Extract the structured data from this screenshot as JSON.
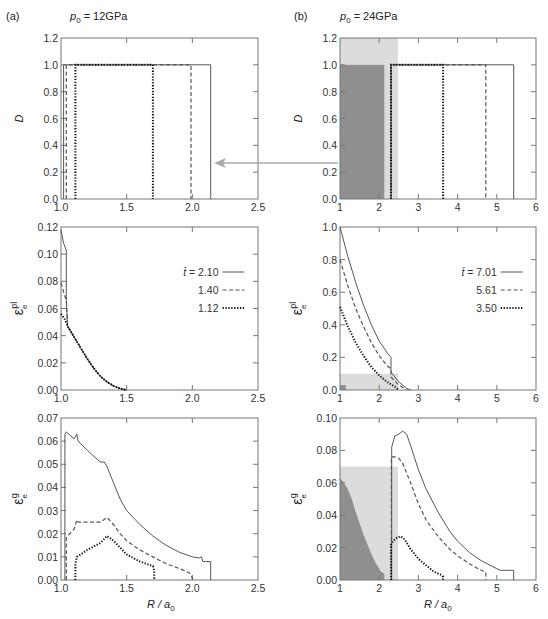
{
  "figure": {
    "panel_a": {
      "label": "(a)",
      "pressure": "p0 = 12GPa",
      "p_sym": "p",
      "p_sub": "0",
      "p_val": " = 12GPa"
    },
    "panel_b": {
      "label": "(b)",
      "pressure": "p0 = 24GPa",
      "p_sym": "p",
      "p_sub": "0",
      "p_val": " = 24GPa"
    },
    "xlabel": "R / a0",
    "xlabel_main": "R / a",
    "xlabel_sub": "0"
  },
  "colors": {
    "frame": "#777777",
    "line": "#555555",
    "dark_shade": "#8f8f8f",
    "light_shade": "#dcdcdc",
    "arrow": "#aaaaaa"
  },
  "chart_data": [
    {
      "id": "a-top",
      "type": "line",
      "title": "(a) p0 = 12GPa",
      "ylabel": "D",
      "xlabel": "",
      "xlim": [
        1.0,
        2.5
      ],
      "ylim": [
        0,
        1.2
      ],
      "xticks": [
        "1.0",
        "1.5",
        "2.0",
        "2.5"
      ],
      "xtick_vals": [
        1.0,
        1.5,
        2.0,
        2.5
      ],
      "yticks": [
        "0.0",
        "0.2",
        "0.4",
        "0.6",
        "0.8",
        "1.0",
        "1.2"
      ],
      "ytick_vals": [
        0,
        0.2,
        0.4,
        0.6,
        0.8,
        1.0,
        1.2
      ],
      "series": [
        {
          "name": "t=2.10",
          "style": "solid",
          "x": [
            1.02,
            1.02,
            2.14,
            2.14
          ],
          "y": [
            0,
            1,
            1,
            0
          ]
        },
        {
          "name": "t=1.40",
          "style": "dashed",
          "x": [
            1.04,
            1.04,
            1.99,
            1.99
          ],
          "y": [
            0,
            1,
            1,
            0
          ]
        },
        {
          "name": "t=1.12",
          "style": "dotted",
          "x": [
            1.11,
            1.11,
            1.7,
            1.7
          ],
          "y": [
            0,
            1,
            1,
            0
          ]
        }
      ]
    },
    {
      "id": "b-top",
      "type": "line",
      "title": "(b) p0 = 24GPa",
      "ylabel": "D",
      "xlabel": "",
      "xlim": [
        1,
        6
      ],
      "ylim": [
        0,
        1.2
      ],
      "xticks": [
        "1",
        "2",
        "3",
        "4",
        "5",
        "6"
      ],
      "xtick_vals": [
        1,
        2,
        3,
        4,
        5,
        6
      ],
      "yticks": [
        "0.0",
        "0.2",
        "0.4",
        "0.6",
        "0.8",
        "1.0",
        "1.2"
      ],
      "ytick_vals": [
        0,
        0.2,
        0.4,
        0.6,
        0.8,
        1.0,
        1.2
      ],
      "shading": {
        "light": {
          "x": [
            1,
            2.48
          ],
          "y": [
            0,
            1.2
          ]
        },
        "dark": {
          "x": [
            1,
            2.13
          ],
          "y": [
            0,
            1.0
          ]
        }
      },
      "series": [
        {
          "name": "t=7.01",
          "style": "solid",
          "x": [
            2.3,
            2.3,
            5.43,
            5.43
          ],
          "y": [
            0,
            1,
            1,
            0
          ]
        },
        {
          "name": "t=5.61",
          "style": "dashed",
          "x": [
            2.3,
            2.3,
            4.72,
            4.72
          ],
          "y": [
            0,
            1,
            1,
            0
          ]
        },
        {
          "name": "t=3.50",
          "style": "dotted",
          "x": [
            2.3,
            2.3,
            3.63,
            3.63
          ],
          "y": [
            0,
            1,
            1,
            0
          ]
        }
      ]
    },
    {
      "id": "a-mid",
      "type": "line",
      "ylabel": "εe^pl",
      "xlabel": "",
      "xlim": [
        1.0,
        2.5
      ],
      "ylim": [
        0,
        0.12
      ],
      "xticks": [
        "1.0",
        "1.5",
        "2.0",
        "2.5"
      ],
      "xtick_vals": [
        1.0,
        1.5,
        2.0,
        2.5
      ],
      "yticks": [
        "0.00",
        "0.02",
        "0.04",
        "0.06",
        "0.08",
        "0.10",
        "0.12"
      ],
      "ytick_vals": [
        0,
        0.02,
        0.04,
        0.06,
        0.08,
        0.1,
        0.12
      ],
      "legend": [
        {
          "prefix": "t̄ = ",
          "value": "2.10",
          "style": "solid"
        },
        {
          "prefix": "",
          "value": "1.40",
          "style": "dashed"
        },
        {
          "prefix": "",
          "value": "1.12",
          "style": "dotted"
        }
      ],
      "series": [
        {
          "name": "t=2.10",
          "style": "solid",
          "x": [
            1.0,
            1.02,
            1.04,
            1.04,
            1.05,
            1.1,
            1.15,
            1.2,
            1.25,
            1.3,
            1.35,
            1.4,
            1.45,
            1.5
          ],
          "y": [
            0.118,
            0.108,
            0.103,
            0.066,
            0.047,
            0.039,
            0.031,
            0.023,
            0.016,
            0.01,
            0.006,
            0.003,
            0.001,
            0.0
          ]
        },
        {
          "name": "t=1.40",
          "style": "dashed",
          "x": [
            1.0,
            1.02,
            1.04,
            1.05,
            1.1,
            1.15,
            1.2,
            1.25,
            1.3,
            1.35,
            1.4,
            1.45,
            1.5
          ],
          "y": [
            0.079,
            0.072,
            0.066,
            0.047,
            0.039,
            0.031,
            0.023,
            0.016,
            0.01,
            0.006,
            0.003,
            0.001,
            0.0
          ]
        },
        {
          "name": "t=1.12",
          "style": "dotted",
          "x": [
            1.0,
            1.03,
            1.05,
            1.1,
            1.15,
            1.2,
            1.25,
            1.3,
            1.35,
            1.4,
            1.45,
            1.5
          ],
          "y": [
            0.056,
            0.052,
            0.047,
            0.039,
            0.031,
            0.023,
            0.016,
            0.01,
            0.006,
            0.003,
            0.001,
            0.0
          ]
        }
      ]
    },
    {
      "id": "b-mid",
      "type": "line",
      "ylabel": "εe^pl",
      "xlabel": "",
      "xlim": [
        1,
        6
      ],
      "ylim": [
        0,
        1.0
      ],
      "xticks": [
        "1",
        "2",
        "3",
        "4",
        "5",
        "6"
      ],
      "xtick_vals": [
        1,
        2,
        3,
        4,
        5,
        6
      ],
      "yticks": [
        "0.0",
        "0.2",
        "0.4",
        "0.6",
        "0.8",
        "1.0"
      ],
      "ytick_vals": [
        0,
        0.2,
        0.4,
        0.6,
        0.8,
        1.0
      ],
      "shading": {
        "light": {
          "x": [
            1,
            2.48
          ],
          "y": [
            0,
            0.1
          ]
        },
        "dark": {
          "x": [
            1,
            1.15
          ],
          "y": [
            0,
            0.03
          ]
        }
      },
      "legend": [
        {
          "prefix": "t̄ = ",
          "value": "7.01",
          "style": "solid"
        },
        {
          "prefix": "",
          "value": "5.61",
          "style": "dashed"
        },
        {
          "prefix": "",
          "value": "3.50",
          "style": "dotted"
        }
      ],
      "series": [
        {
          "name": "t=7.01",
          "style": "solid",
          "x": [
            1.0,
            1.2,
            1.4,
            1.6,
            1.8,
            2.0,
            2.2,
            2.3,
            2.3,
            2.5,
            2.7,
            2.8
          ],
          "y": [
            1.0,
            0.82,
            0.66,
            0.52,
            0.4,
            0.3,
            0.23,
            0.2,
            0.11,
            0.05,
            0.01,
            0.0
          ]
        },
        {
          "name": "t=5.61",
          "style": "dashed",
          "x": [
            1.0,
            1.2,
            1.4,
            1.6,
            1.8,
            2.0,
            2.2,
            2.3,
            2.3,
            2.5,
            2.7
          ],
          "y": [
            0.8,
            0.64,
            0.5,
            0.39,
            0.29,
            0.21,
            0.15,
            0.13,
            0.08,
            0.03,
            0.0
          ]
        },
        {
          "name": "t=3.50",
          "style": "dotted",
          "x": [
            1.0,
            1.2,
            1.4,
            1.6,
            1.8,
            2.0,
            2.2,
            2.4,
            2.5
          ],
          "y": [
            0.51,
            0.39,
            0.29,
            0.21,
            0.14,
            0.09,
            0.05,
            0.02,
            0.0
          ]
        }
      ]
    },
    {
      "id": "a-bot",
      "type": "line",
      "ylabel": "εe^g",
      "xlabel": "R / a0",
      "xlim": [
        1.0,
        2.5
      ],
      "ylim": [
        0,
        0.07
      ],
      "xticks": [
        "1.0",
        "1.5",
        "2.0",
        "2.5"
      ],
      "xtick_vals": [
        1.0,
        1.5,
        2.0,
        2.5
      ],
      "yticks": [
        "0.00",
        "0.01",
        "0.02",
        "0.03",
        "0.04",
        "0.05",
        "0.06",
        "0.07"
      ],
      "ytick_vals": [
        0,
        0.01,
        0.02,
        0.03,
        0.04,
        0.05,
        0.06,
        0.07
      ],
      "series": [
        {
          "name": "t=2.10",
          "style": "solid",
          "x": [
            1.03,
            1.03,
            1.04,
            1.1,
            1.12,
            1.13,
            1.2,
            1.3,
            1.33,
            1.35,
            1.4,
            1.45,
            1.5,
            1.6,
            1.7,
            1.8,
            1.9,
            2.0,
            2.05,
            2.07,
            2.08,
            2.1,
            2.14,
            2.14
          ],
          "y": [
            0,
            0.063,
            0.064,
            0.061,
            0.063,
            0.06,
            0.056,
            0.051,
            0.051,
            0.049,
            0.042,
            0.035,
            0.03,
            0.024,
            0.019,
            0.015,
            0.012,
            0.01,
            0.0095,
            0.01,
            0.008,
            0.008,
            0.008,
            0
          ]
        },
        {
          "name": "t=1.40",
          "style": "dashed",
          "x": [
            1.04,
            1.04,
            1.05,
            1.1,
            1.12,
            1.13,
            1.2,
            1.3,
            1.35,
            1.4,
            1.45,
            1.5,
            1.6,
            1.7,
            1.8,
            1.9,
            1.98,
            2.0,
            2.0
          ],
          "y": [
            0,
            0.018,
            0.019,
            0.022,
            0.026,
            0.025,
            0.025,
            0.025,
            0.027,
            0.024,
            0.02,
            0.017,
            0.013,
            0.01,
            0.007,
            0.005,
            0.003,
            0.001,
            0
          ]
        },
        {
          "name": "t=1.12",
          "style": "dotted",
          "x": [
            1.11,
            1.11,
            1.12,
            1.15,
            1.2,
            1.3,
            1.35,
            1.4,
            1.45,
            1.5,
            1.6,
            1.7,
            1.71,
            1.71
          ],
          "y": [
            0,
            0.007,
            0.01,
            0.011,
            0.013,
            0.016,
            0.019,
            0.017,
            0.014,
            0.011,
            0.008,
            0.006,
            0.004,
            0
          ]
        }
      ]
    },
    {
      "id": "b-bot",
      "type": "line",
      "ylabel": "εe^g",
      "xlabel": "R / a0",
      "xlim": [
        1,
        6
      ],
      "ylim": [
        0,
        0.1
      ],
      "xticks": [
        "1",
        "2",
        "3",
        "4",
        "5",
        "6"
      ],
      "xtick_vals": [
        1,
        2,
        3,
        4,
        5,
        6
      ],
      "yticks": [
        "0.00",
        "0.02",
        "0.04",
        "0.06",
        "0.08",
        "0.10"
      ],
      "ytick_vals": [
        0,
        0.02,
        0.04,
        0.06,
        0.08,
        0.1
      ],
      "shading": {
        "light": {
          "x": [
            1,
            2.48
          ],
          "y": [
            0,
            0.07
          ]
        },
        "dark_profile": {
          "x": [
            1.0,
            1.0,
            1.1,
            1.2,
            1.3,
            1.4,
            1.5,
            1.6,
            1.7,
            1.8,
            1.9,
            2.0,
            2.05,
            2.13,
            2.13
          ],
          "y": [
            0,
            0.063,
            0.06,
            0.056,
            0.05,
            0.042,
            0.035,
            0.028,
            0.022,
            0.016,
            0.011,
            0.007,
            0.005,
            0.004,
            0
          ]
        }
      },
      "series": [
        {
          "name": "t=7.01",
          "style": "solid",
          "x": [
            2.32,
            2.32,
            2.4,
            2.5,
            2.6,
            2.7,
            2.8,
            3.0,
            3.2,
            3.5,
            3.8,
            4.0,
            4.3,
            4.6,
            5.0,
            5.1,
            5.43,
            5.43
          ],
          "y": [
            0,
            0.082,
            0.089,
            0.09,
            0.092,
            0.09,
            0.083,
            0.068,
            0.056,
            0.042,
            0.03,
            0.024,
            0.017,
            0.012,
            0.007,
            0.006,
            0.006,
            0
          ]
        },
        {
          "name": "t=5.61",
          "style": "dashed",
          "x": [
            2.31,
            2.31,
            2.4,
            2.5,
            2.6,
            2.8,
            3.0,
            3.2,
            3.5,
            3.8,
            4.0,
            4.3,
            4.6,
            4.72,
            4.72
          ],
          "y": [
            0,
            0.076,
            0.076,
            0.075,
            0.072,
            0.06,
            0.047,
            0.037,
            0.027,
            0.019,
            0.015,
            0.01,
            0.006,
            0.005,
            0
          ]
        },
        {
          "name": "t=3.50",
          "style": "dotted",
          "x": [
            2.3,
            2.3,
            2.35,
            2.45,
            2.55,
            2.65,
            2.8,
            3.0,
            3.2,
            3.4,
            3.6,
            3.63,
            3.63
          ],
          "y": [
            0,
            0.022,
            0.024,
            0.026,
            0.027,
            0.025,
            0.019,
            0.013,
            0.009,
            0.005,
            0.003,
            0.002,
            0
          ]
        }
      ]
    }
  ],
  "annotation": {
    "arrow": "points from panel (b) D transition region toward panel (a) D plot"
  }
}
